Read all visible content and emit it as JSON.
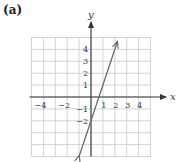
{
  "panel": {
    "label": "(a)"
  },
  "chart_data": {
    "type": "line",
    "title": "",
    "panel_label": "(a)",
    "xlabel": "x",
    "ylabel": "y",
    "xlim": [
      -5,
      5
    ],
    "ylim": [
      -5,
      5
    ],
    "grid": true,
    "x_tick_labels": [
      "-4",
      "-2",
      "1",
      "2",
      "3",
      "4"
    ],
    "x_ticks": [
      -4,
      -2,
      1,
      2,
      3,
      4
    ],
    "y_tick_labels": [
      "4",
      "3",
      "2",
      "1",
      "-1",
      "-2"
    ],
    "y_ticks": [
      4,
      3,
      2,
      1,
      -1,
      -2
    ],
    "series": [
      {
        "name": "y = 3x - 2",
        "equation": "y = 3x - 2",
        "x": [
          -1,
          0,
          0.667,
          2.2
        ],
        "y": [
          -5,
          -2,
          0,
          4.6
        ],
        "arrows": "both"
      }
    ]
  }
}
